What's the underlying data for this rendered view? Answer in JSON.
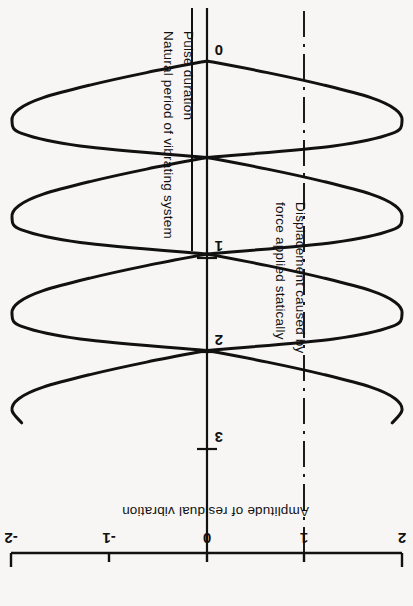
{
  "figure": {
    "background_color": "#f7f6f4",
    "ink_color": "#111111",
    "orientation_note": "plot printed rotated 180 degrees"
  },
  "axes": {
    "amplitude_axis": {
      "title": "Amplitude of residual vibration",
      "ticks": [
        "2",
        "1",
        "0",
        "-1",
        "-2"
      ],
      "values": [
        2,
        1,
        0,
        -1,
        -2
      ],
      "min": -2,
      "max": 2
    },
    "ratio_axis": {
      "title_numerator": "Pulse duration",
      "title_denominator": "Natural period of vibrating system",
      "ticks": [
        "0",
        "1",
        "2",
        "3"
      ],
      "values": [
        0,
        1,
        2,
        3
      ],
      "min": 0,
      "max": 3.75
    }
  },
  "annotations": {
    "static_displacement": {
      "line_1": "Displacement caused by",
      "line_2": "force applied statically",
      "at_amplitude": 1,
      "line_style": "dash-dot"
    }
  },
  "chart_data": {
    "type": "line",
    "title": "",
    "subtitle": "",
    "xlabel": "Amplitude of residual vibration",
    "ylabel": "Pulse duration / Natural period of vibrating system",
    "xlim": [
      2,
      -2
    ],
    "ylim": [
      0,
      3.75
    ],
    "grid": false,
    "legend": "none",
    "orientation": "rotated-180",
    "x_tick_labels": [
      "2",
      "1",
      "0",
      "-1",
      "-2"
    ],
    "x_tick_values": [
      2,
      1,
      0,
      -1,
      -2
    ],
    "y_tick_labels": [
      "0",
      "1",
      "2",
      "3"
    ],
    "y_tick_values": [
      0,
      1,
      2,
      3
    ],
    "reference_lines": [
      {
        "name": "zero-amplitude-axis",
        "amplitude": 0,
        "style": "solid"
      },
      {
        "name": "static-displacement-line",
        "amplitude": 1,
        "style": "dash-dot"
      }
    ],
    "series": [
      {
        "name": "Upper envelope (positive residual amplitude)",
        "description": "Lobes peaking at +2 between integer ratios, returning to 0 at ratio = 0, 1, 2, 3",
        "ratio": [
          0.0,
          0.12,
          0.25,
          0.38,
          0.5,
          0.62,
          0.75,
          0.88,
          1.0,
          1.12,
          1.25,
          1.38,
          1.5,
          1.62,
          1.75,
          1.88,
          2.0,
          2.12,
          2.25,
          2.38,
          2.5,
          2.62,
          2.75,
          2.88,
          3.0,
          3.12,
          3.25,
          3.38,
          3.5,
          3.62,
          3.75
        ],
        "amplitude": [
          0.0,
          0.62,
          1.2,
          1.68,
          1.93,
          2.0,
          1.9,
          1.3,
          0.0,
          0.62,
          1.2,
          1.68,
          1.93,
          2.0,
          1.9,
          1.3,
          0.0,
          0.62,
          1.2,
          1.68,
          1.93,
          2.0,
          1.9,
          1.3,
          0.0,
          0.62,
          1.2,
          1.68,
          1.93,
          2.0,
          1.9
        ]
      },
      {
        "name": "Lower envelope (negative residual amplitude)",
        "description": "Mirror lobes peaking at -2 between integer ratios, returning to 0 at ratio = 0, 1, 2, 3",
        "ratio": [
          0.0,
          0.12,
          0.25,
          0.38,
          0.5,
          0.62,
          0.75,
          0.88,
          1.0,
          1.12,
          1.25,
          1.38,
          1.5,
          1.62,
          1.75,
          1.88,
          2.0,
          2.12,
          2.25,
          2.38,
          2.5,
          2.62,
          2.75,
          2.88,
          3.0,
          3.12,
          3.25,
          3.38,
          3.5,
          3.62,
          3.75
        ],
        "amplitude": [
          0.0,
          -0.62,
          -1.2,
          -1.68,
          -1.93,
          -2.0,
          -1.9,
          -1.3,
          0.0,
          -0.62,
          -1.2,
          -1.68,
          -1.93,
          -2.0,
          -1.9,
          -1.3,
          0.0,
          -0.62,
          -1.2,
          -1.68,
          -1.93,
          -2.0,
          -1.9,
          -1.3,
          0.0,
          -0.62,
          -1.2,
          -1.68,
          -1.93,
          -2.0,
          -1.9
        ]
      }
    ]
  }
}
